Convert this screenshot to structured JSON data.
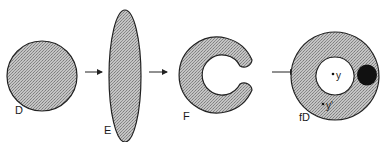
{
  "diagram": {
    "colors": {
      "fill_pattern_light": "#bdbdbd",
      "fill_pattern_dark": "#8a8a8a",
      "stroke": "#222222",
      "blob": "#111111",
      "background": "#ffffff"
    },
    "shapes": [
      {
        "id": "D",
        "label": "D",
        "kind": "disk"
      },
      {
        "id": "E",
        "label": "E",
        "kind": "elongated ellipse"
      },
      {
        "id": "F",
        "label": "F",
        "kind": "C-shape (horseshoe)"
      },
      {
        "id": "fD",
        "label": "fD",
        "kind": "annulus with dark blob"
      }
    ],
    "points": [
      {
        "label": "y"
      },
      {
        "label": "y'"
      }
    ],
    "arrows": [
      {
        "from": "D",
        "to": "E"
      },
      {
        "from": "E",
        "to": "F"
      },
      {
        "from": "F",
        "to": "fD"
      }
    ]
  }
}
